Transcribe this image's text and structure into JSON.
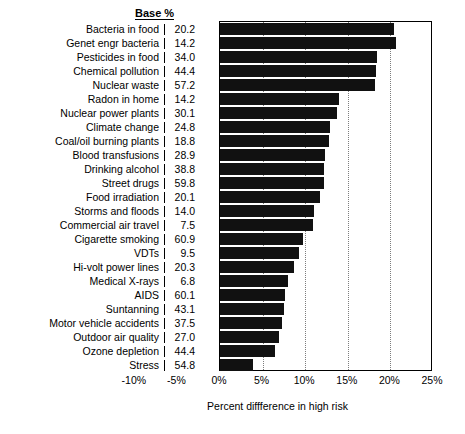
{
  "header": {
    "base_column_label": "Base %"
  },
  "chart_data": {
    "type": "bar",
    "orientation": "horizontal",
    "title": "",
    "xlabel": "Percent diffference in high risk",
    "ylabel": "",
    "xlim": [
      -10,
      25
    ],
    "xticks": [
      "-10%",
      "-5%",
      "0%",
      "5%",
      "10%",
      "15%",
      "20%",
      "25%"
    ],
    "xtick_values": [
      -10,
      -5,
      0,
      5,
      10,
      15,
      20,
      25
    ],
    "grid": true,
    "gridlines_at": [
      5,
      10,
      15,
      20
    ],
    "legend": "none",
    "bar_color": "#111111",
    "extra_column_header": "Base %",
    "categories": [
      "Bacteria in food",
      "Genet engr bacteria",
      "Pesticides in food",
      "Chemical pollution",
      "Nuclear waste",
      "Radon in home",
      "Nuclear power plants",
      "Climate change",
      "Coal/oil burning plants",
      "Blood transfusions",
      "Drinking alcohol",
      "Street drugs",
      "Food irradiation",
      "Storms and floods",
      "Commercial air travel",
      "Cigarette smoking",
      "VDTs",
      "Hi-volt power lines",
      "Medical X-rays",
      "AIDS",
      "Suntanning",
      "Motor vehicle accidents",
      "Outdoor air quality",
      "Ozone depletion",
      "Stress"
    ],
    "base_percent": [
      "20.2",
      "14.2",
      "34.0",
      "44.4",
      "57.2",
      "14.2",
      "30.1",
      "24.8",
      "18.8",
      "28.9",
      "38.8",
      "59.8",
      "20.1",
      "14.0",
      "7.5",
      "60.9",
      "9.5",
      "20.3",
      "6.8",
      "60.1",
      "43.1",
      "37.5",
      "27.0",
      "44.4",
      "54.8"
    ],
    "values": [
      20.4,
      20.7,
      18.4,
      18.3,
      18.2,
      14.0,
      13.7,
      12.9,
      12.8,
      12.3,
      12.2,
      12.2,
      11.7,
      11.0,
      10.9,
      9.8,
      9.3,
      8.7,
      8.0,
      7.6,
      7.5,
      7.3,
      6.9,
      6.5,
      3.9
    ]
  }
}
